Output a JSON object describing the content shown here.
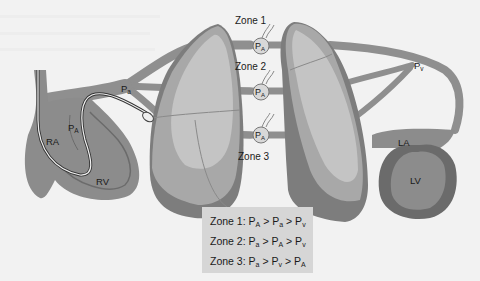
{
  "diagram": {
    "zones": [
      {
        "label": "Zone 1",
        "alveolus_label": "P",
        "alveolus_sub": "A"
      },
      {
        "label": "Zone 2",
        "alveolus_label": "P",
        "alveolus_sub": "A"
      },
      {
        "label": "Zone 3",
        "alveolus_label": "P",
        "alveolus_sub": "A"
      }
    ],
    "heart_labels": {
      "ra": "RA",
      "rv": "RV",
      "la": "LA",
      "lv": "LV"
    },
    "pressure_labels": {
      "pa_artery": {
        "main": "P",
        "sub": "a"
      },
      "pa_alveolar_near_heart": {
        "main": "P",
        "sub": "A"
      },
      "pv_vein": {
        "main": "P",
        "sub": "v"
      }
    },
    "colors": {
      "background": "#f2f2f2",
      "vessel": "#8f8f8f",
      "vessel_dark": "#6e6e6e",
      "lung_light": "#c4c4c4",
      "lung_mid": "#a8a8a8",
      "lung_dark": "#7d7d7d",
      "heart_dark": "#6b6b6b",
      "heart_mid": "#8c8c8c",
      "legend_bg": "#d6d6d6"
    }
  },
  "legend": {
    "rows": [
      {
        "zone": "Zone 1:",
        "p1": "P",
        "s1": "A",
        "op1": ">",
        "p2": "P",
        "s2": "a",
        "op2": ">",
        "p3": "P",
        "s3": "v"
      },
      {
        "zone": "Zone 2:",
        "p1": "P",
        "s1": "a",
        "op1": ">",
        "p2": "P",
        "s2": "A",
        "op2": ">",
        "p3": "P",
        "s3": "v"
      },
      {
        "zone": "Zone 3:",
        "p1": "P",
        "s1": "a",
        "op1": ">",
        "p2": "P",
        "s2": "v",
        "op2": ">",
        "p3": "P",
        "s3": "A"
      }
    ]
  }
}
